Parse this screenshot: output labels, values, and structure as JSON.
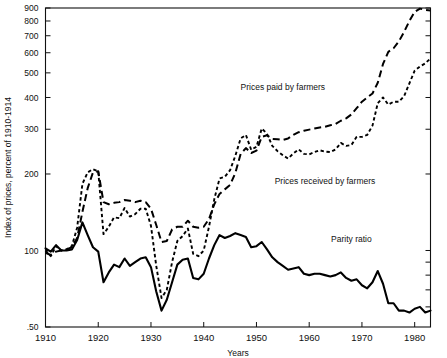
{
  "chart_data": {
    "type": "line",
    "title": "",
    "xlabel": "Years",
    "ylabel": "Index of prices, percent of 1910-1914",
    "xlim": [
      1910,
      1983
    ],
    "ylim": [
      50,
      900
    ],
    "yscale": "log",
    "grid": false,
    "legend": "inline-annotations",
    "ytick_labels": [
      "900",
      "800",
      "700",
      "600",
      "500",
      "400",
      "300",
      "200",
      "100",
      ".50"
    ],
    "ytick_values": [
      900,
      800,
      700,
      600,
      500,
      400,
      300,
      200,
      100,
      50
    ],
    "xtick_labels": [
      "1910",
      "1920",
      "1930",
      "1940",
      "1950",
      "1960",
      "1970",
      "1980"
    ],
    "xtick_values": [
      1910,
      1920,
      1930,
      1940,
      1950,
      1960,
      1970,
      1980
    ],
    "annotations": [
      {
        "text": "Prices paid by farmers",
        "x": 1955,
        "y": 430,
        "series": "prices_paid"
      },
      {
        "text": "Prices received by farmers",
        "x": 1963,
        "y": 182,
        "series": "prices_received"
      },
      {
        "text": "Parity ratio",
        "x": 1968,
        "y": 108,
        "series": "parity_ratio"
      }
    ],
    "series": [
      {
        "name": "Prices paid by farmers",
        "style": "long-dash",
        "color": "#000000",
        "x": [
          1910,
          1911,
          1912,
          1913,
          1914,
          1915,
          1916,
          1917,
          1918,
          1919,
          1920,
          1921,
          1922,
          1923,
          1924,
          1925,
          1926,
          1927,
          1928,
          1929,
          1930,
          1931,
          1932,
          1933,
          1934,
          1935,
          1936,
          1937,
          1938,
          1939,
          1940,
          1941,
          1942,
          1943,
          1944,
          1945,
          1946,
          1947,
          1948,
          1949,
          1950,
          1951,
          1952,
          1953,
          1954,
          1955,
          1956,
          1957,
          1958,
          1959,
          1960,
          1961,
          1962,
          1963,
          1964,
          1965,
          1966,
          1967,
          1968,
          1969,
          1970,
          1971,
          1972,
          1973,
          1974,
          1975,
          1976,
          1977,
          1978,
          1979,
          1980,
          1981,
          1982,
          1983
        ],
        "values": [
          98,
          96,
          99,
          100,
          101,
          103,
          112,
          142,
          176,
          203,
          205,
          155,
          152,
          154,
          155,
          158,
          157,
          155,
          157,
          155,
          146,
          126,
          108,
          109,
          121,
          124,
          124,
          131,
          124,
          123,
          124,
          133,
          152,
          167,
          174,
          181,
          202,
          240,
          253,
          242,
          247,
          280,
          284,
          275,
          274,
          272,
          276,
          285,
          292,
          296,
          299,
          302,
          305,
          307,
          311,
          315,
          324,
          331,
          343,
          363,
          385,
          400,
          415,
          457,
          542,
          605,
          625,
          665,
          725,
          800,
          870,
          895,
          885,
          880
        ],
        "note": "Index of prices paid by farmers, log scale"
      },
      {
        "name": "Prices received by farmers",
        "style": "short-dash",
        "color": "#000000",
        "x": [
          1910,
          1911,
          1912,
          1913,
          1914,
          1915,
          1916,
          1917,
          1918,
          1919,
          1920,
          1921,
          1922,
          1923,
          1924,
          1925,
          1926,
          1927,
          1928,
          1929,
          1930,
          1931,
          1932,
          1933,
          1934,
          1935,
          1936,
          1937,
          1938,
          1939,
          1940,
          1941,
          1942,
          1943,
          1944,
          1945,
          1946,
          1947,
          1948,
          1949,
          1950,
          1951,
          1952,
          1953,
          1954,
          1955,
          1956,
          1957,
          1958,
          1959,
          1960,
          1961,
          1962,
          1963,
          1964,
          1965,
          1966,
          1967,
          1968,
          1969,
          1970,
          1971,
          1972,
          1973,
          1974,
          1975,
          1976,
          1977,
          1978,
          1979,
          1980,
          1981,
          1982,
          1983
        ],
        "values": [
          100,
          95,
          104,
          100,
          101,
          104,
          123,
          183,
          203,
          209,
          205,
          116,
          124,
          135,
          134,
          147,
          136,
          139,
          146,
          146,
          125,
          87,
          65,
          70,
          90,
          109,
          114,
          122,
          97,
          95,
          100,
          124,
          159,
          192,
          195,
          207,
          236,
          276,
          285,
          249,
          256,
          302,
          288,
          258,
          246,
          237,
          230,
          241,
          250,
          240,
          239,
          244,
          248,
          245,
          244,
          250,
          265,
          258,
          260,
          280,
          280,
          285,
          310,
          380,
          400,
          375,
          385,
          385,
          405,
          455,
          510,
          530,
          545,
          570
        ],
        "note": "Index of prices received by farmers, log scale"
      },
      {
        "name": "Parity ratio",
        "style": "solid",
        "color": "#000000",
        "x": [
          1910,
          1911,
          1912,
          1913,
          1914,
          1915,
          1916,
          1917,
          1918,
          1919,
          1920,
          1921,
          1922,
          1923,
          1924,
          1925,
          1926,
          1927,
          1928,
          1929,
          1930,
          1931,
          1932,
          1933,
          1934,
          1935,
          1936,
          1937,
          1938,
          1939,
          1940,
          1941,
          1942,
          1943,
          1944,
          1945,
          1946,
          1947,
          1948,
          1949,
          1950,
          1951,
          1952,
          1953,
          1954,
          1955,
          1956,
          1957,
          1958,
          1959,
          1960,
          1961,
          1962,
          1963,
          1964,
          1965,
          1966,
          1967,
          1968,
          1969,
          1970,
          1971,
          1972,
          1973,
          1974,
          1975,
          1976,
          1977,
          1978,
          1979,
          1980,
          1981,
          1982,
          1983
        ],
        "values": [
          102,
          99,
          105,
          100,
          100,
          101,
          110,
          129,
          115,
          103,
          99,
          75,
          82,
          88,
          86,
          93,
          87,
          90,
          93,
          94,
          86,
          69,
          58,
          64,
          75,
          88,
          92,
          93,
          78,
          77,
          81,
          93,
          105,
          115,
          112,
          114,
          117,
          115,
          113,
          103,
          104,
          108,
          101,
          94,
          90,
          87,
          84,
          85,
          86,
          81,
          80,
          81,
          81,
          80,
          79,
          80,
          82,
          78,
          76,
          77,
          73,
          71,
          75,
          83,
          74,
          62,
          62,
          58,
          58,
          57,
          59,
          60,
          57,
          58
        ],
        "note": "Parity ratio = received/paid x 100, log scale"
      }
    ]
  }
}
